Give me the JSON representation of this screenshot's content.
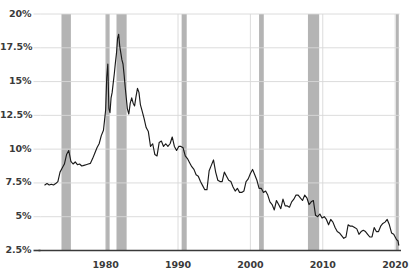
{
  "chart_data": {
    "type": "line",
    "title": "",
    "subtitle": "",
    "xlabel": "",
    "ylabel": "",
    "xlim": [
      1971.0,
      2020.6
    ],
    "ylim": [
      2.5,
      20
    ],
    "grid": true,
    "legend": "none",
    "y_ticks": [
      2.5,
      5,
      7.5,
      10,
      12.5,
      15,
      17.5,
      20
    ],
    "y_tick_labels": [
      "2.5%",
      "5%",
      "7.5%",
      "10%",
      "12.5%",
      "15%",
      "17.5%",
      "20%"
    ],
    "x_ticks": [
      1980,
      1990,
      2000,
      2010,
      2020
    ],
    "x_tick_labels": [
      "1980",
      "1990",
      "2000",
      "2010",
      "2020"
    ],
    "line_color": "#1a1a1a",
    "recession_band_color": "#b4b4b4",
    "grid_color": "#d8d8d8",
    "axis_color": "#3a3a3a",
    "background_color": "#ffffff",
    "shaded_regions": [
      {
        "name": "recession-1973",
        "start": 1973.9,
        "end": 1975.2
      },
      {
        "name": "recession-1980",
        "start": 1980.0,
        "end": 1980.55
      },
      {
        "name": "recession-1981",
        "start": 1981.5,
        "end": 1982.9
      },
      {
        "name": "recession-1990",
        "start": 1990.5,
        "end": 1991.2
      },
      {
        "name": "recession-2001",
        "start": 2001.2,
        "end": 2001.85
      },
      {
        "name": "recession-2008",
        "start": 2007.95,
        "end": 2009.5
      },
      {
        "name": "recession-2020",
        "start": 2020.1,
        "end": 2020.5
      }
    ],
    "series": [
      {
        "name": "rate",
        "x": [
          1971.6,
          1971.9,
          1972.2,
          1972.5,
          1972.8,
          1973.1,
          1973.4,
          1973.7,
          1974.0,
          1974.3,
          1974.6,
          1974.9,
          1975.2,
          1975.5,
          1975.8,
          1976.1,
          1976.4,
          1976.7,
          1977.0,
          1977.3,
          1977.6,
          1977.9,
          1978.2,
          1978.5,
          1978.8,
          1979.1,
          1979.4,
          1979.7,
          1980.0,
          1980.15,
          1980.3,
          1980.45,
          1980.6,
          1980.75,
          1980.9,
          1981.05,
          1981.2,
          1981.35,
          1981.5,
          1981.65,
          1981.8,
          1981.95,
          1982.1,
          1982.25,
          1982.4,
          1982.55,
          1982.7,
          1982.85,
          1983.0,
          1983.2,
          1983.4,
          1983.6,
          1983.8,
          1984.0,
          1984.2,
          1984.4,
          1984.6,
          1984.8,
          1985.0,
          1985.3,
          1985.6,
          1985.9,
          1986.2,
          1986.5,
          1986.8,
          1987.1,
          1987.4,
          1987.7,
          1988.0,
          1988.3,
          1988.6,
          1988.9,
          1989.2,
          1989.5,
          1989.8,
          1990.1,
          1990.4,
          1990.7,
          1991.0,
          1991.3,
          1991.6,
          1991.9,
          1992.2,
          1992.5,
          1992.8,
          1993.1,
          1993.4,
          1993.7,
          1994.0,
          1994.3,
          1994.6,
          1994.9,
          1995.2,
          1995.5,
          1995.8,
          1996.1,
          1996.4,
          1996.7,
          1997.0,
          1997.3,
          1997.6,
          1997.9,
          1998.2,
          1998.5,
          1998.8,
          1999.1,
          1999.4,
          1999.7,
          2000.0,
          2000.3,
          2000.6,
          2000.9,
          2001.2,
          2001.5,
          2001.8,
          2002.1,
          2002.4,
          2002.7,
          2003.0,
          2003.3,
          2003.6,
          2003.9,
          2004.2,
          2004.5,
          2004.8,
          2005.1,
          2005.4,
          2005.7,
          2006.0,
          2006.3,
          2006.6,
          2006.9,
          2007.2,
          2007.5,
          2007.8,
          2008.1,
          2008.4,
          2008.7,
          2009.0,
          2009.3,
          2009.6,
          2009.9,
          2010.2,
          2010.5,
          2010.8,
          2011.1,
          2011.4,
          2011.7,
          2012.0,
          2012.3,
          2012.6,
          2012.9,
          2013.2,
          2013.5,
          2013.8,
          2014.1,
          2014.4,
          2014.7,
          2015.0,
          2015.3,
          2015.6,
          2015.9,
          2016.2,
          2016.5,
          2016.8,
          2017.1,
          2017.4,
          2017.7,
          2018.0,
          2018.3,
          2018.6,
          2018.9,
          2019.2,
          2019.5,
          2019.8,
          2020.0,
          2020.2,
          2020.4,
          2020.5
        ],
        "y": [
          7.35,
          7.45,
          7.35,
          7.4,
          7.35,
          7.45,
          7.6,
          8.3,
          8.6,
          8.9,
          9.6,
          9.9,
          9.1,
          8.9,
          9.05,
          8.85,
          8.9,
          8.75,
          8.8,
          8.85,
          8.9,
          8.95,
          9.3,
          9.7,
          10.1,
          10.4,
          11.0,
          11.4,
          12.9,
          15.3,
          16.3,
          13.0,
          12.7,
          13.8,
          14.2,
          14.9,
          15.6,
          16.4,
          17.1,
          18.2,
          18.5,
          17.6,
          17.1,
          16.6,
          16.3,
          15.5,
          14.6,
          13.8,
          13.0,
          12.6,
          13.4,
          13.8,
          13.4,
          13.2,
          13.9,
          14.5,
          14.2,
          13.3,
          12.9,
          12.3,
          11.6,
          11.3,
          10.2,
          10.4,
          9.6,
          9.5,
          10.5,
          10.6,
          10.2,
          10.4,
          10.2,
          10.4,
          10.9,
          10.2,
          9.9,
          10.2,
          10.2,
          10.1,
          9.5,
          9.3,
          9.0,
          8.7,
          8.5,
          8.1,
          8.0,
          7.6,
          7.3,
          7.0,
          7.0,
          8.4,
          8.8,
          9.2,
          8.3,
          7.7,
          7.6,
          7.6,
          8.3,
          8.0,
          7.7,
          7.6,
          7.2,
          6.9,
          7.1,
          6.8,
          6.8,
          6.9,
          7.6,
          7.8,
          8.2,
          8.5,
          8.1,
          7.7,
          7.1,
          7.1,
          6.8,
          6.9,
          6.6,
          6.1,
          5.9,
          5.5,
          6.2,
          5.9,
          5.6,
          6.3,
          5.8,
          5.8,
          5.7,
          6.1,
          6.3,
          6.6,
          6.6,
          6.4,
          6.2,
          6.6,
          6.4,
          5.9,
          6.1,
          6.2,
          5.1,
          5.0,
          5.2,
          4.9,
          5.0,
          4.8,
          4.4,
          4.8,
          4.6,
          4.2,
          3.9,
          3.8,
          3.6,
          3.4,
          3.5,
          4.4,
          4.3,
          4.3,
          4.2,
          4.1,
          3.7,
          3.9,
          4.0,
          3.9,
          3.7,
          3.5,
          3.5,
          4.2,
          3.9,
          3.9,
          4.3,
          4.5,
          4.6,
          4.8,
          4.4,
          3.8,
          3.7,
          3.5,
          3.3,
          3.2,
          2.9
        ]
      }
    ]
  }
}
